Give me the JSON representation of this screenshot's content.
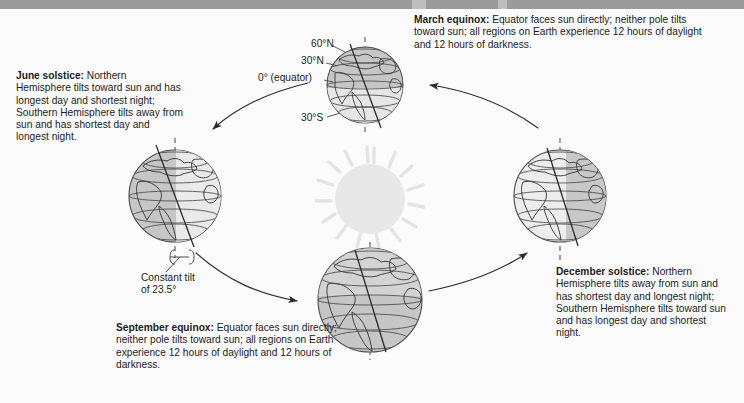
{
  "figure": {
    "background_color": "#fbfbfb",
    "topbar_color": "#9b9b9b"
  },
  "sun": {
    "name": "Sun",
    "fill_color": "#e8e8e8",
    "ray_count": 16
  },
  "captions": {
    "june_solstice": {
      "term": "June solstice:",
      "text": " Northern Hemisphere tilts toward sun and has longest day and shortest night; Southern Hemisphere tilts away from sun and has shortest day and longest night."
    },
    "march_equinox": {
      "term": "March equinox:",
      "text": " Equator faces sun directly; neither pole tilts toward sun; all regions on Earth experience 12 hours of daylight and 12 hours of darkness."
    },
    "december_solstice": {
      "term": "December solstice:",
      "text": " Northern Hemisphere tilts away from sun and has shortest day and longest night; Southern Hemisphere tilts toward sun and has longest day and shortest night."
    },
    "september_equinox": {
      "term": "September equinox:",
      "text": " Equator faces sun directly; neither pole tilts toward sun; all regions on Earth experience 12 hours of daylight and 12 hours of darkness."
    }
  },
  "latitude_labels": {
    "lat_60n": "60°N",
    "lat_30n": "30°N",
    "lat_0": "0° (equator)",
    "lat_30s": "30°S"
  },
  "tilt_annotation": {
    "line1": "Constant tilt",
    "line2": "of 23.5°",
    "degrees": 23.5
  },
  "globes": {
    "june": {
      "label": "June solstice globe",
      "center_x": 175,
      "center_y": 196,
      "radius": 46,
      "axis_tilt_deg": 23.5,
      "lit_side": "right"
    },
    "march": {
      "label": "March equinox globe",
      "center_x": 365,
      "center_y": 85,
      "radius": 38,
      "axis_tilt_deg": 23.5,
      "lit_side": "bottom"
    },
    "december": {
      "label": "December solstice globe",
      "center_x": 560,
      "center_y": 196,
      "radius": 46,
      "axis_tilt_deg": 23.5,
      "lit_side": "left"
    },
    "september": {
      "label": "September equinox globe",
      "center_x": 370,
      "center_y": 300,
      "radius": 52,
      "axis_tilt_deg": 23.5,
      "lit_side": "top"
    }
  },
  "orbit": {
    "description": "Elliptical orbit path with four directional arrows indicating counterclockwise motion"
  }
}
